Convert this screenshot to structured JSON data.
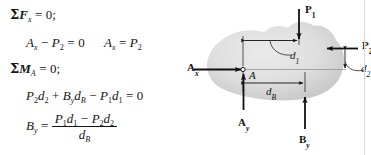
{
  "document": {
    "type": "engineering-statics-worked-example",
    "page_edge_line_color": "#d8d8d8",
    "background_color": "#ffffff",
    "text_color": "#141414"
  },
  "equations": {
    "line1": {
      "label": "sum-of-forces-x-equilibrium",
      "sigma": "Σ",
      "quantity": "F",
      "subscript": "x",
      "relation": "=",
      "value": "0;"
    },
    "line2": {
      "label": "solve-Ax",
      "term1": "A",
      "term1_sub": "x",
      "op1": "−",
      "term2": "P",
      "term2_sub": "2",
      "relation": "=",
      "value": "0"
    },
    "line2b": {
      "label": "Ax-result",
      "lhs": "A",
      "lhs_sub": "x",
      "relation": "=",
      "rhs": "P",
      "rhs_sub": "2"
    },
    "line3": {
      "label": "sum-of-moments-about-A-equilibrium",
      "sigma": "Σ",
      "quantity": "M",
      "subscript": "A",
      "relation": "=",
      "value": "0;"
    },
    "line4": {
      "label": "moment-equation",
      "t1": "P",
      "t1_sub": "2",
      "t1b": "d",
      "t1b_sub": "2",
      "op1": "+",
      "t2": "B",
      "t2_sub": "y",
      "t2b": "d",
      "t2b_sub": "B",
      "op2": "−",
      "t3": "P",
      "t3_sub": "1",
      "t3b": "d",
      "t3b_sub": "1",
      "relation": "=",
      "value": "0"
    },
    "line5": {
      "label": "By-result",
      "lhs": "B",
      "lhs_sub": "y",
      "relation": "=",
      "numerator": {
        "a": "P",
        "a_sub": "1",
        "ab": "d",
        "ab_sub": "1",
        "op": "−",
        "b": "P",
        "b_sub": "2",
        "bb": "d",
        "bb_sub": "2"
      },
      "denominator": {
        "d": "d",
        "d_sub": "B"
      }
    }
  },
  "diagram": {
    "body_shape": {
      "name": "rigid-body-blob",
      "fill_light": "#e3e3e3",
      "fill_mid": "#d5d5d5",
      "fill_dark": "#c6c6c6",
      "outline": "none"
    },
    "point_A": {
      "label": "A",
      "marker": "small-open-circle"
    },
    "forces": [
      {
        "name": "P1",
        "label": "P",
        "subscript": "1",
        "direction": "down",
        "placement": "top of body"
      },
      {
        "name": "P2",
        "label": "P",
        "subscript": "2",
        "direction": "left",
        "placement": "right of body"
      },
      {
        "name": "Ax",
        "label": "A",
        "subscript": "x",
        "direction": "right",
        "placement": "left, into point A"
      },
      {
        "name": "Ay",
        "label": "A",
        "subscript": "y",
        "direction": "up",
        "placement": "below point A"
      },
      {
        "name": "By",
        "label": "B",
        "subscript": "y",
        "direction": "up",
        "placement": "below right of body"
      }
    ],
    "dimensions": [
      {
        "name": "d1",
        "label": "d",
        "subscript": "1",
        "orientation": "horizontal",
        "between": "point A vertical and P1 line of action",
        "leader": "curved"
      },
      {
        "name": "d2",
        "label": "d",
        "subscript": "2",
        "orientation": "vertical",
        "between": "point A horizontal and P2 line of action",
        "leader": "curved"
      },
      {
        "name": "dB",
        "label": "d",
        "subscript": "B",
        "orientation": "horizontal",
        "between": "point A and By line of action",
        "leader": "straight with arrowheads"
      }
    ]
  }
}
